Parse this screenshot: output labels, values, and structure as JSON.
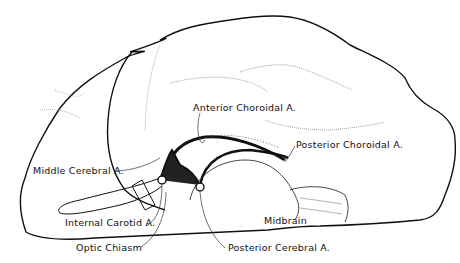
{
  "diagram": {
    "type": "anatomical-illustration",
    "labels": {
      "anterior_choroidal": "Anterior Choroidal A.",
      "posterior_choroidal": "Posterior Choroidal A.",
      "middle_cerebral": "Middle Cerebral A.",
      "internal_carotid": "Internal Carotid A.",
      "optic_chiasm": "Optic Chiasm",
      "midbrain": "Midbrain",
      "posterior_cerebral": "Posterior Cerebral A."
    }
  }
}
